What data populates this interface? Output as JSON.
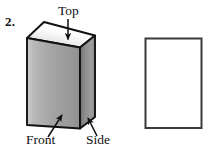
{
  "exercise": {
    "number": "2."
  },
  "figure": {
    "name": "rectangular-prism-with-face-labels",
    "labels": {
      "top": "Top",
      "front": "Front",
      "side": "Side"
    },
    "colors": {
      "outline": "#111111",
      "top_face_light": "#ffffff",
      "top_face_shadow": "#b9b9b9",
      "front_face_light": "#d9d9d9",
      "front_face_dark": "#8d8d8d",
      "side_face_light": "#9a9a9a",
      "side_face_dark": "#6f6f6f",
      "paper": "#ffffff"
    }
  },
  "answer_box": {
    "name": "empty-rectangle-outline",
    "value": ""
  }
}
